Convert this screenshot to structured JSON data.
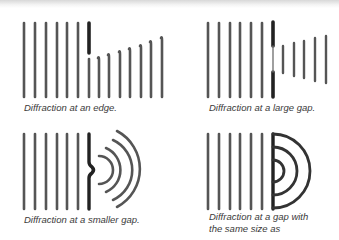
{
  "colors": {
    "wave": "#555555",
    "barrier": "#222222",
    "caption": "#3a3a3a",
    "background": "#ffffff"
  },
  "panels": [
    {
      "id": "edge",
      "caption": "Diffraction at an edge.",
      "incoming_wavefronts": 6,
      "obstacle": "edge",
      "diffracted_wavefronts": 8
    },
    {
      "id": "large-gap",
      "caption": "Diffraction at a large gap.",
      "incoming_wavefronts": 6,
      "obstacle": "large gap",
      "diffracted_wavefronts": 5
    },
    {
      "id": "smaller-gap",
      "caption": "Diffraction at a smaller gap.",
      "incoming_wavefronts": 6,
      "obstacle": "small gap",
      "diffracted_wavefronts": 4
    },
    {
      "id": "same-size-gap",
      "caption_line1": "Diffraction at a gap with",
      "caption_line2": "the same size as",
      "incoming_wavefronts": 6,
      "obstacle": "gap equal to wavelength",
      "diffracted_wavefronts": 3
    }
  ]
}
